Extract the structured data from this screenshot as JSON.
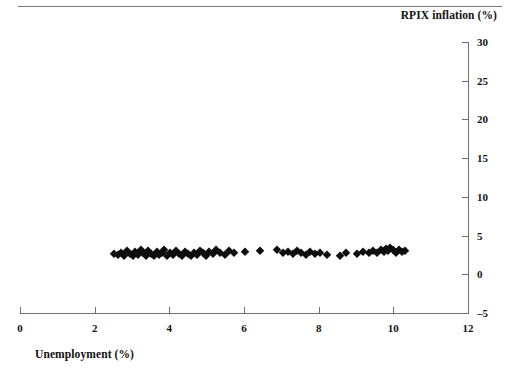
{
  "figure": {
    "width": 509,
    "height": 380,
    "background": "#ffffff",
    "rule_color": "#7c7c7c",
    "axis_color": "#6e6e6e",
    "marker_color": "#0d0d0d"
  },
  "chart_data": {
    "type": "scatter",
    "title": "",
    "ylabel": "RPIX inflation (%)",
    "xlabel": "Unemployment (%)",
    "xlim": [
      0,
      12
    ],
    "ylim": [
      -5,
      30
    ],
    "xticks": [
      0,
      2,
      4,
      6,
      8,
      10,
      12
    ],
    "xtick_labels": [
      "0",
      "2",
      "4",
      "6",
      "8",
      "10",
      "12"
    ],
    "yticks": [
      -5,
      0,
      5,
      10,
      15,
      20,
      25,
      30
    ],
    "ytick_labels": [
      "–5",
      "0",
      "5",
      "10",
      "15",
      "20",
      "25",
      "30"
    ],
    "y_axis_position": "right",
    "x_axis_position": "bottom",
    "grid": false,
    "legend": null,
    "marker": "diamond",
    "marker_size": 9,
    "series": [
      {
        "name": "RPIX inflation vs unemployment",
        "points": [
          [
            2.52,
            2.6
          ],
          [
            2.62,
            2.5
          ],
          [
            2.7,
            2.8
          ],
          [
            2.78,
            2.4
          ],
          [
            2.86,
            3.0
          ],
          [
            2.94,
            2.6
          ],
          [
            3.02,
            2.3
          ],
          [
            3.08,
            2.9
          ],
          [
            3.16,
            2.5
          ],
          [
            3.24,
            3.2
          ],
          [
            3.3,
            2.7
          ],
          [
            3.38,
            2.4
          ],
          [
            3.44,
            3.0
          ],
          [
            3.52,
            2.6
          ],
          [
            3.58,
            2.3
          ],
          [
            3.66,
            2.9
          ],
          [
            3.72,
            2.5
          ],
          [
            3.8,
            2.7
          ],
          [
            3.86,
            3.1
          ],
          [
            3.94,
            2.4
          ],
          [
            4.02,
            2.8
          ],
          [
            4.1,
            2.5
          ],
          [
            4.18,
            3.0
          ],
          [
            4.26,
            2.6
          ],
          [
            4.34,
            2.3
          ],
          [
            4.42,
            2.9
          ],
          [
            4.5,
            2.6
          ],
          [
            4.58,
            2.4
          ],
          [
            4.66,
            2.8
          ],
          [
            4.74,
            2.5
          ],
          [
            4.82,
            3.0
          ],
          [
            4.9,
            2.7
          ],
          [
            4.98,
            2.4
          ],
          [
            5.06,
            2.9
          ],
          [
            5.16,
            2.6
          ],
          [
            5.26,
            3.1
          ],
          [
            5.36,
            2.7
          ],
          [
            5.48,
            2.5
          ],
          [
            5.6,
            3.0
          ],
          [
            5.74,
            2.8
          ],
          [
            6.02,
            2.9
          ],
          [
            6.42,
            3.0
          ],
          [
            6.88,
            3.1
          ],
          [
            7.04,
            2.7
          ],
          [
            7.18,
            2.9
          ],
          [
            7.3,
            2.6
          ],
          [
            7.42,
            3.0
          ],
          [
            7.54,
            2.7
          ],
          [
            7.66,
            2.5
          ],
          [
            7.78,
            2.9
          ],
          [
            7.9,
            2.6
          ],
          [
            8.04,
            2.8
          ],
          [
            8.22,
            2.5
          ],
          [
            8.58,
            2.4
          ],
          [
            8.74,
            2.7
          ],
          [
            9.02,
            2.6
          ],
          [
            9.2,
            2.9
          ],
          [
            9.34,
            2.7
          ],
          [
            9.46,
            3.0
          ],
          [
            9.56,
            2.8
          ],
          [
            9.66,
            3.1
          ],
          [
            9.74,
            2.9
          ],
          [
            9.8,
            3.3
          ],
          [
            9.86,
            3.0
          ],
          [
            9.92,
            3.4
          ],
          [
            9.98,
            3.1
          ],
          [
            10.06,
            2.8
          ],
          [
            10.14,
            3.2
          ],
          [
            10.22,
            2.9
          ],
          [
            10.3,
            3.0
          ]
        ]
      }
    ]
  }
}
